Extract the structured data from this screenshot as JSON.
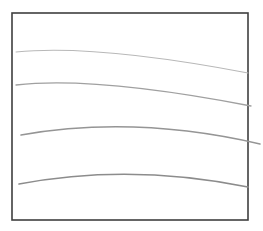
{
  "diagram": {
    "type": "curved-lines-in-frame",
    "frame": {
      "x": 12,
      "y": 13,
      "width": 236,
      "height": 207,
      "stroke": "#3f3f3f",
      "stroke_width": 1.6
    },
    "curves": [
      {
        "id": "curve-1",
        "start": [
          16,
          52
        ],
        "control": [
          95,
          44
        ],
        "end": [
          248,
          73
        ],
        "stroke": "#b8b8b8",
        "stroke_width": 1.1
      },
      {
        "id": "curve-2",
        "start": [
          16,
          85
        ],
        "control": [
          95,
          76
        ],
        "end": [
          251,
          106
        ],
        "stroke": "#a0a0a0",
        "stroke_width": 1.3
      },
      {
        "id": "curve-3",
        "start": [
          21,
          135
        ],
        "control": [
          135,
          115
        ],
        "end": [
          260,
          144
        ],
        "stroke": "#959595",
        "stroke_width": 1.5
      },
      {
        "id": "curve-4",
        "start": [
          19,
          184
        ],
        "control": [
          130,
          163
        ],
        "end": [
          248,
          187
        ],
        "stroke": "#8c8c8c",
        "stroke_width": 1.6
      }
    ]
  }
}
